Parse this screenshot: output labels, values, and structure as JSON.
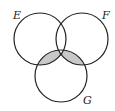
{
  "diagram": {
    "type": "venn",
    "sets": [
      {
        "name": "E",
        "cx": 40,
        "cy": 39,
        "r": 26
      },
      {
        "name": "F",
        "cx": 82,
        "cy": 39,
        "r": 26
      },
      {
        "name": "G",
        "cx": 61,
        "cy": 76,
        "r": 26
      }
    ],
    "shaded_regions": [
      "E∩G only",
      "F∩G only"
    ],
    "unshaded_regions": [
      "E∩F∩G",
      "E only",
      "F only",
      "G only",
      "E∩F only"
    ],
    "colors": {
      "stroke": "#222222",
      "shade": "#c8c8c8",
      "background": "#ffffff"
    },
    "labels": {
      "e": "E",
      "f": "F",
      "g": "G"
    }
  }
}
